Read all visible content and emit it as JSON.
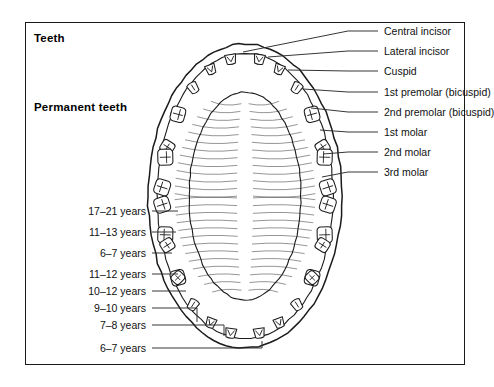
{
  "figure": {
    "title": "Teeth",
    "subtitle": "Permanent teeth",
    "view": "Occlusal view of permanent dentition: maxillary (upper) arch above, mandibular (lower) arch below",
    "border_color": "#1a1a1a",
    "ink_color": "#1b1b1b",
    "background": "#ffffff"
  },
  "tooth_labels": [
    {
      "id": "central-incisor",
      "text": "Central incisor",
      "y": 31,
      "line_from_x": 348,
      "line_to_x": 378,
      "anchor_x": 243,
      "anchor_y": 52
    },
    {
      "id": "lateral-incisor",
      "text": "Lateral incisor",
      "y": 51,
      "line_from_x": 348,
      "line_to_x": 378,
      "anchor_x": 268,
      "anchor_y": 57
    },
    {
      "id": "cuspid",
      "text": "Cuspid",
      "y": 71,
      "line_from_x": 348,
      "line_to_x": 378,
      "anchor_x": 288,
      "anchor_y": 70
    },
    {
      "id": "first-premolar",
      "text": "1st premolar (bicuspid)",
      "y": 92,
      "line_from_x": 348,
      "line_to_x": 378,
      "anchor_x": 303,
      "anchor_y": 89
    },
    {
      "id": "second-premolar",
      "text": "2nd premolar (bicuspid)",
      "y": 112,
      "line_from_x": 348,
      "line_to_x": 378,
      "anchor_x": 311,
      "anchor_y": 108
    },
    {
      "id": "first-molar",
      "text": "1st molar",
      "y": 132,
      "line_from_x": 348,
      "line_to_x": 378,
      "anchor_x": 320,
      "anchor_y": 130
    },
    {
      "id": "second-molar",
      "text": "2nd molar",
      "y": 152,
      "line_from_x": 348,
      "line_to_x": 378,
      "anchor_x": 323,
      "anchor_y": 154
    },
    {
      "id": "third-molar",
      "text": "3rd molar",
      "y": 172,
      "line_from_x": 348,
      "line_to_x": 378,
      "anchor_x": 322,
      "anchor_y": 177
    }
  ],
  "age_labels": [
    {
      "id": "age-third-molar",
      "text": "17–21 years",
      "y": 211,
      "line_from_x": 152,
      "line_to_x": 178,
      "bend": false
    },
    {
      "id": "age-second-molar",
      "text": "11–13 years",
      "y": 232,
      "line_from_x": 152,
      "line_to_x": 176,
      "bend": false
    },
    {
      "id": "age-first-molar",
      "text": "6–7 years",
      "y": 253,
      "line_from_x": 152,
      "line_to_x": 172,
      "bend": false
    },
    {
      "id": "age-second-premolar",
      "text": "11–12 years",
      "y": 274,
      "line_from_x": 152,
      "line_to_x": 178,
      "bend": false
    },
    {
      "id": "age-first-premolar",
      "text": "10–12 years",
      "y": 291,
      "line_from_x": 152,
      "line_to_x": 186,
      "bend": false
    },
    {
      "id": "age-cuspid",
      "text": "9–10 years",
      "y": 308,
      "line_from_x": 152,
      "line_to_x": 197,
      "bend": true,
      "bend_y": 322
    },
    {
      "id": "age-lateral-incisor",
      "text": "7–8 years",
      "y": 325,
      "line_from_x": 152,
      "line_to_x": 224,
      "bend": true,
      "bend_y": 336
    },
    {
      "id": "age-central-incisor",
      "text": "6–7 years",
      "y": 348,
      "line_from_x": 152,
      "line_to_x": 262,
      "bend": true,
      "bend_y": 341
    }
  ],
  "chart_data": {
    "type": "diagram",
    "title": "Permanent teeth",
    "upper_arch_teeth": [
      "3rd molar",
      "2nd molar",
      "1st molar",
      "2nd premolar (bicuspid)",
      "1st premolar (bicuspid)",
      "Cuspid",
      "Lateral incisor",
      "Central incisor"
    ],
    "eruption_ages": [
      {
        "tooth": "3rd molar",
        "age": "17–21 years"
      },
      {
        "tooth": "2nd molar",
        "age": "11–13 years"
      },
      {
        "tooth": "1st molar",
        "age": "6–7 years"
      },
      {
        "tooth": "2nd premolar",
        "age": "11–12 years"
      },
      {
        "tooth": "1st premolar",
        "age": "10–12 years"
      },
      {
        "tooth": "Cuspid",
        "age": "9–10 years"
      },
      {
        "tooth": "Lateral incisor",
        "age": "7–8 years"
      },
      {
        "tooth": "Central incisor",
        "age": "6–7 years"
      }
    ],
    "teeth_per_arch": 16,
    "total_teeth": 32
  }
}
